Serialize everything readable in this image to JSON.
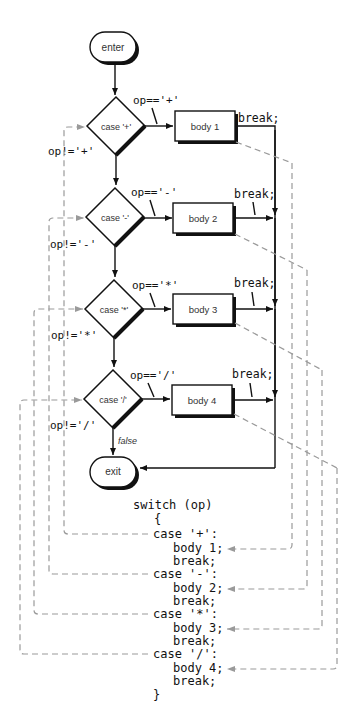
{
  "flowchart": {
    "enter_label": "enter",
    "exit_label": "exit",
    "false_label": "false",
    "cases": [
      {
        "decision": "case '+'",
        "true_cond": "op=='+'",
        "false_cond": "op!='+'",
        "body": "body 1",
        "break": "break;"
      },
      {
        "decision": "case '-'",
        "true_cond": "op=='-'",
        "false_cond": "op!='-'",
        "body": "body 2",
        "break": "break;"
      },
      {
        "decision": "case '*'",
        "true_cond": "op=='*'",
        "false_cond": "op!='*'",
        "body": "body 3",
        "break": "break;"
      },
      {
        "decision": "case '/'",
        "true_cond": "op=='/'",
        "false_cond": "op!='/'",
        "body": "body 4",
        "break": "break;"
      }
    ]
  },
  "code": {
    "lines": [
      "switch (op)",
      "{",
      "case '+':",
      "body 1;",
      "break;",
      "case '-':",
      "body 2;",
      "break;",
      "case '*':",
      "body 3;",
      "break;",
      "case '/':",
      "body 4;",
      "break;",
      "}"
    ]
  },
  "colors": {
    "line": "#111111",
    "dashed_link": "#9a9a9a"
  }
}
